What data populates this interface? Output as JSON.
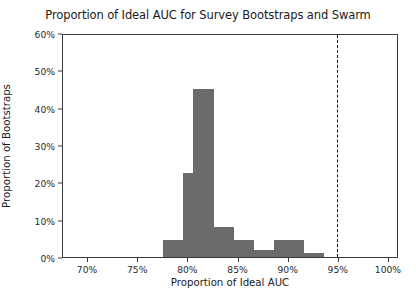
{
  "chart_data": {
    "type": "bar",
    "title": "Proportion of Ideal AUC for Survey Bootstraps and Swarm",
    "xlabel": "Proportion of Ideal AUC",
    "ylabel": "Proportion of Bootstraps",
    "xlim": [
      0.675,
      1.01
    ],
    "ylim": [
      0,
      0.6
    ],
    "grid": false,
    "legend": null,
    "bar_color": "#6b6b6b",
    "bin_width": 0.01,
    "x_ticks": [
      {
        "value": 0.7,
        "label": "70%"
      },
      {
        "value": 0.75,
        "label": "75%"
      },
      {
        "value": 0.8,
        "label": "80%"
      },
      {
        "value": 0.85,
        "label": "85%"
      },
      {
        "value": 0.9,
        "label": "90%"
      },
      {
        "value": 0.95,
        "label": "95%"
      },
      {
        "value": 1.0,
        "label": "100%"
      }
    ],
    "y_ticks": [
      {
        "value": 0.0,
        "label": "0%"
      },
      {
        "value": 0.1,
        "label": "10%"
      },
      {
        "value": 0.2,
        "label": "20%"
      },
      {
        "value": 0.3,
        "label": "30%"
      },
      {
        "value": 0.4,
        "label": "40%"
      },
      {
        "value": 0.5,
        "label": "50%"
      },
      {
        "value": 0.6,
        "label": "60%"
      }
    ],
    "bins": [
      {
        "x0": 0.765,
        "x1": 0.775,
        "value": 0.0
      },
      {
        "x0": 0.775,
        "x1": 0.785,
        "value": 0.045
      },
      {
        "x0": 0.785,
        "x1": 0.795,
        "value": 0.045
      },
      {
        "x0": 0.795,
        "x1": 0.805,
        "value": 0.225
      },
      {
        "x0": 0.805,
        "x1": 0.815,
        "value": 0.45
      },
      {
        "x0": 0.815,
        "x1": 0.825,
        "value": 0.45
      },
      {
        "x0": 0.825,
        "x1": 0.835,
        "value": 0.08
      },
      {
        "x0": 0.835,
        "x1": 0.845,
        "value": 0.08
      },
      {
        "x0": 0.845,
        "x1": 0.855,
        "value": 0.045
      },
      {
        "x0": 0.855,
        "x1": 0.865,
        "value": 0.045
      },
      {
        "x0": 0.865,
        "x1": 0.875,
        "value": 0.02
      },
      {
        "x0": 0.875,
        "x1": 0.885,
        "value": 0.02
      },
      {
        "x0": 0.885,
        "x1": 0.895,
        "value": 0.045
      },
      {
        "x0": 0.895,
        "x1": 0.905,
        "value": 0.045
      },
      {
        "x0": 0.905,
        "x1": 0.915,
        "value": 0.045
      },
      {
        "x0": 0.915,
        "x1": 0.925,
        "value": 0.012
      },
      {
        "x0": 0.925,
        "x1": 0.935,
        "value": 0.012
      }
    ],
    "annotations": [
      {
        "name": "swarm-threshold",
        "x": 0.948,
        "style": "dashed",
        "color": "#111111",
        "line1": "Swarm Rankings",
        "line2": "p-value < .001"
      }
    ]
  }
}
